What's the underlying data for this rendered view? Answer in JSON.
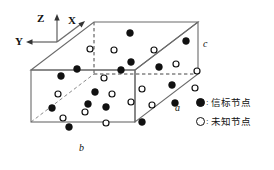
{
  "figure": {
    "type": "3d-cuboid-node-distribution",
    "background": "#ffffff",
    "stroke_color": "#6b6b6b",
    "node_color": "#111111"
  },
  "axes": {
    "origin": [
      57,
      42
    ],
    "items": [
      {
        "name": "Z",
        "label": "Z",
        "direction": "up",
        "tip": [
          57,
          15
        ]
      },
      {
        "name": "X",
        "label": "X",
        "direction": "up-right",
        "tip": [
          84,
          18
        ]
      },
      {
        "name": "Y",
        "label": "Y",
        "direction": "left",
        "tip": [
          26,
          42
        ]
      }
    ]
  },
  "box": {
    "edge_labels": {
      "a": "a",
      "b": "b",
      "c": "c"
    },
    "front_face": {
      "x": 31,
      "y": 70,
      "w": 104,
      "h": 52
    },
    "depth_vector": {
      "dx": 63,
      "dy": -48
    },
    "solid_stroke": "#6b6b6b",
    "dashed_stroke": "#444444"
  },
  "legend": {
    "title": "",
    "items": [
      {
        "marker": "filled-circle",
        "separator": ":",
        "label": "信标节点"
      },
      {
        "marker": "hollow-circle",
        "separator": ":",
        "label": "未知节点"
      }
    ]
  },
  "nodes": {
    "beacon_label": "信标节点",
    "unknown_label": "未知节点",
    "beacon_count": 15,
    "unknown_count": 15,
    "beacon": [
      [
        130,
        33
      ],
      [
        186,
        41
      ],
      [
        131,
        62
      ],
      [
        159,
        67
      ],
      [
        61,
        76
      ],
      [
        77,
        69
      ],
      [
        172,
        85
      ],
      [
        95,
        92
      ],
      [
        52,
        108
      ],
      [
        106,
        107
      ],
      [
        142,
        122
      ],
      [
        69,
        127
      ],
      [
        121,
        70
      ],
      [
        88,
        104
      ],
      [
        175,
        103
      ]
    ],
    "unknown": [
      [
        90,
        49
      ],
      [
        114,
        50
      ],
      [
        154,
        50
      ],
      [
        176,
        64
      ],
      [
        104,
        78
      ],
      [
        142,
        89
      ],
      [
        152,
        105
      ],
      [
        58,
        94
      ],
      [
        112,
        94
      ],
      [
        85,
        112
      ],
      [
        106,
        123
      ],
      [
        197,
        71
      ],
      [
        195,
        88
      ],
      [
        131,
        102
      ],
      [
        63,
        118
      ]
    ]
  }
}
